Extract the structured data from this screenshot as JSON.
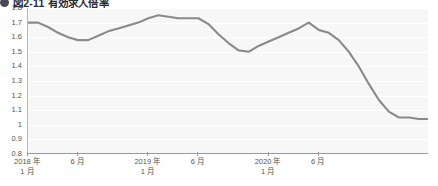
{
  "title": {
    "bullet_icon": "filled-circle-bullet-icon",
    "text": "図2-11 有効求人倍率"
  },
  "chart_data": {
    "type": "line",
    "title": "図2-11 有効求人倍率",
    "xlabel": "",
    "ylabel": "",
    "ylim": [
      0.8,
      1.8
    ],
    "yticks": [
      "1.8",
      "1.7",
      "1.6",
      "1.5",
      "1.4",
      "1.3",
      "1.2",
      "1.1",
      "1",
      "0.9",
      "0.8"
    ],
    "grid": true,
    "legend": "none",
    "line_color": "#8a8a8a",
    "plot_background": "#f7f7f7",
    "x_tick_labels": [
      {
        "line1": "2018 年",
        "line2": "1 月",
        "index": 0
      },
      {
        "line1": "6 月",
        "line2": "",
        "index": 5
      },
      {
        "line1": "2019 年",
        "line2": "1 月",
        "index": 12
      },
      {
        "line1": "6 月",
        "line2": "",
        "index": 17
      },
      {
        "line1": "2020 年",
        "line2": "1 月",
        "index": 24
      },
      {
        "line1": "6 月",
        "line2": "",
        "index": 29
      }
    ],
    "x": [
      "2018-01",
      "2018-02",
      "2018-03",
      "2018-04",
      "2018-05",
      "2018-06",
      "2018-07",
      "2018-08",
      "2018-09",
      "2018-10",
      "2018-11",
      "2018-12",
      "2019-01",
      "2019-02",
      "2019-03",
      "2019-04",
      "2019-05",
      "2019-06",
      "2019-07",
      "2019-08",
      "2019-09",
      "2019-10",
      "2019-11",
      "2019-12",
      "2020-01",
      "2020-02",
      "2020-03",
      "2020-04",
      "2020-05",
      "2020-06",
      "2020-07",
      "2020-08",
      "2020-09"
    ],
    "values": [
      1.7,
      1.7,
      1.67,
      1.63,
      1.6,
      1.58,
      1.58,
      1.61,
      1.64,
      1.66,
      1.68,
      1.7,
      1.73,
      1.75,
      1.74,
      1.73,
      1.73,
      1.73,
      1.69,
      1.62,
      1.56,
      1.51,
      1.5,
      1.54,
      1.57,
      1.6,
      1.63,
      1.66,
      1.7,
      1.65,
      1.63,
      1.58,
      1.5
    ],
    "values_tail": [
      1.4,
      1.28,
      1.17,
      1.09,
      1.05,
      1.05,
      1.04,
      1.04
    ]
  }
}
